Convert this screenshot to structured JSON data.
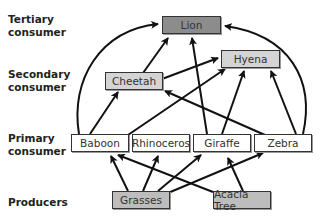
{
  "levels": {
    "tertiary": "Tertiary consumer",
    "secondary": "Secondary consumer",
    "primary": "Primary consumer",
    "producers": "Producers"
  },
  "nodes": {
    "lion": {
      "label": "Lion",
      "color": "#8c8c8c"
    },
    "hyena": {
      "label": "Hyena",
      "color": "#d4d4d4"
    },
    "cheetah": {
      "label": "Cheetah",
      "color": "#d4d4d4"
    },
    "baboon": {
      "label": "Baboon",
      "color": "#ffffff"
    },
    "rhinoceros": {
      "label": "Rhinoceros",
      "color": "#ffffff"
    },
    "giraffe": {
      "label": "Giraffe",
      "color": "#ffffff"
    },
    "zebra": {
      "label": "Zebra",
      "color": "#ffffff"
    },
    "grasses": {
      "label": "Grasses",
      "color": "#bdbdbd"
    },
    "acacia": {
      "label": "Acacia Tree",
      "color": "#bdbdbd"
    }
  },
  "edges": [
    {
      "from": "Baboon",
      "to": "Lion"
    },
    {
      "from": "Baboon",
      "to": "Cheetah"
    },
    {
      "from": "Baboon",
      "to": "Hyena"
    },
    {
      "from": "Cheetah",
      "to": "Lion"
    },
    {
      "from": "Cheetah",
      "to": "Hyena"
    },
    {
      "from": "Giraffe",
      "to": "Lion"
    },
    {
      "from": "Giraffe",
      "to": "Hyena"
    },
    {
      "from": "Zebra",
      "to": "Hyena"
    },
    {
      "from": "Zebra",
      "to": "Lion"
    },
    {
      "from": "Zebra",
      "to": "Cheetah"
    },
    {
      "from": "Grasses",
      "to": "Baboon"
    },
    {
      "from": "Grasses",
      "to": "Rhinoceros"
    },
    {
      "from": "Grasses",
      "to": "Giraffe"
    },
    {
      "from": "Grasses",
      "to": "Zebra"
    },
    {
      "from": "Acacia Tree",
      "to": "Baboon"
    },
    {
      "from": "Acacia Tree",
      "to": "Giraffe"
    }
  ]
}
